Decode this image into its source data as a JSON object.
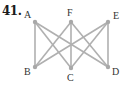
{
  "problem_number": "41.",
  "graph": {
    "edge_color": "#b0b0b0",
    "node_color": "#a8a8a8",
    "vertices": [
      {
        "id": "A",
        "x": 35,
        "y": 22,
        "lx": 24,
        "ly": 18
      },
      {
        "id": "F",
        "x": 71,
        "y": 22,
        "lx": 67,
        "ly": 16
      },
      {
        "id": "E",
        "x": 108,
        "y": 22,
        "lx": 113,
        "ly": 19
      },
      {
        "id": "B",
        "x": 35,
        "y": 67,
        "lx": 24,
        "ly": 75
      },
      {
        "id": "C",
        "x": 71,
        "y": 68,
        "lx": 67,
        "ly": 81
      },
      {
        "id": "D",
        "x": 108,
        "y": 67,
        "lx": 112,
        "ly": 75
      }
    ],
    "edges": [
      [
        "A",
        "B"
      ],
      [
        "A",
        "C"
      ],
      [
        "A",
        "D"
      ],
      [
        "F",
        "B"
      ],
      [
        "F",
        "C"
      ],
      [
        "F",
        "D"
      ],
      [
        "E",
        "B"
      ],
      [
        "E",
        "C"
      ],
      [
        "E",
        "D"
      ]
    ]
  }
}
